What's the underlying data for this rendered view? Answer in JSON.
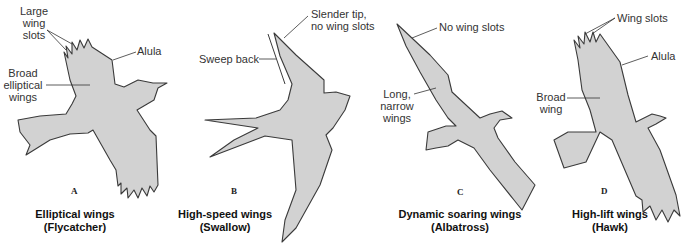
{
  "figure": {
    "panels": [
      {
        "letter": "A",
        "caption_line1": "Elliptical wings",
        "caption_line2": "(Flycatcher)",
        "annotations": {
          "wing_slots": [
            "Large",
            "wing",
            "slots"
          ],
          "alula": "Alula",
          "wing_shape": [
            "Broad",
            "elliptical",
            "wings"
          ]
        }
      },
      {
        "letter": "B",
        "caption_line1": "High-speed wings",
        "caption_line2": "(Swallow)",
        "annotations": {
          "tip": [
            "Slender tip,",
            "no wing slots"
          ],
          "sweep": "Sweep back"
        }
      },
      {
        "letter": "C",
        "caption_line1": "Dynamic soaring wings",
        "caption_line2": "(Albatross)",
        "annotations": {
          "slots": "No wing slots",
          "wing_shape": [
            "Long,",
            "narrow",
            "wings"
          ]
        }
      },
      {
        "letter": "D",
        "caption_line1": "High-lift wings",
        "caption_line2": "(Hawk)",
        "annotations": {
          "slots": "Wing slots",
          "alula": "Alula",
          "wing_shape": [
            "Broad",
            "wing"
          ]
        }
      }
    ],
    "colors": {
      "bird_fill": "#d2d2d2",
      "outline": "#3a3a3a",
      "text": "#333333"
    }
  }
}
